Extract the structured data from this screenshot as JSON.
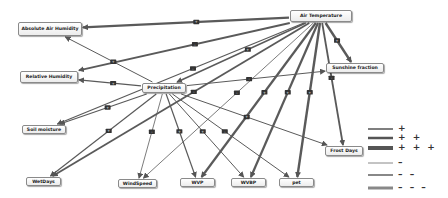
{
  "nodes": [
    {
      "id": "air_temp",
      "label": "Air Temperature",
      "x": 290,
      "y": 10,
      "w": 62,
      "h": 12
    },
    {
      "id": "abs_hum",
      "label": "Absolute Air Humidity",
      "x": 18,
      "y": 22,
      "w": 64,
      "h": 14
    },
    {
      "id": "rel_hum",
      "label": "Relative Humidity",
      "x": 20,
      "y": 71,
      "w": 58,
      "h": 12
    },
    {
      "id": "precip",
      "label": "Precipitation",
      "x": 142,
      "y": 83,
      "w": 44,
      "h": 10
    },
    {
      "id": "sunshine",
      "label": "Sunshine fraction",
      "x": 326,
      "y": 63,
      "w": 58,
      "h": 10
    },
    {
      "id": "soil",
      "label": "Soil moisture",
      "x": 22,
      "y": 125,
      "w": 44,
      "h": 9
    },
    {
      "id": "frost",
      "label": "Frost Days",
      "x": 325,
      "y": 146,
      "w": 38,
      "h": 10
    },
    {
      "id": "wetdays",
      "label": "WetDays",
      "x": 26,
      "y": 177,
      "w": 35,
      "h": 9
    },
    {
      "id": "windspeed",
      "label": "WindSpeed",
      "x": 118,
      "y": 179,
      "w": 39,
      "h": 9
    },
    {
      "id": "wvp",
      "label": "WVP",
      "x": 180,
      "y": 178,
      "w": 35,
      "h": 9
    },
    {
      "id": "wvbp",
      "label": "WVBP",
      "x": 231,
      "y": 178,
      "w": 35,
      "h": 9
    },
    {
      "id": "pet",
      "label": "pet",
      "x": 279,
      "y": 178,
      "w": 35,
      "h": 9
    }
  ],
  "edges": [
    {
      "from": "air_temp",
      "to": "abs_hum",
      "width": 2.2,
      "sign": "+"
    },
    {
      "from": "air_temp",
      "to": "rel_hum",
      "width": 1.8,
      "sign": "-"
    },
    {
      "from": "air_temp",
      "to": "sunshine",
      "width": 2.4,
      "sign": "+"
    },
    {
      "from": "air_temp",
      "to": "precip",
      "width": 1.4,
      "sign": "+"
    },
    {
      "from": "air_temp",
      "to": "soil",
      "width": 1.2,
      "sign": "-"
    },
    {
      "from": "air_temp",
      "to": "wetdays",
      "width": 1.8,
      "sign": "-"
    },
    {
      "from": "air_temp",
      "to": "windspeed",
      "width": 0.8,
      "sign": "-"
    },
    {
      "from": "air_temp",
      "to": "wvp",
      "width": 2.2,
      "sign": "+"
    },
    {
      "from": "air_temp",
      "to": "wvbp",
      "width": 2.2,
      "sign": "+"
    },
    {
      "from": "air_temp",
      "to": "pet",
      "width": 2.4,
      "sign": "+"
    },
    {
      "from": "air_temp",
      "to": "frost",
      "width": 1.8,
      "sign": "-"
    },
    {
      "from": "precip",
      "to": "abs_hum",
      "width": 1.0,
      "sign": "+"
    },
    {
      "from": "precip",
      "to": "rel_hum",
      "width": 1.2,
      "sign": "+"
    },
    {
      "from": "precip",
      "to": "soil",
      "width": 1.2,
      "sign": "+"
    },
    {
      "from": "precip",
      "to": "wetdays",
      "width": 1.2,
      "sign": "+"
    },
    {
      "from": "precip",
      "to": "windspeed",
      "width": 0.8,
      "sign": "-"
    },
    {
      "from": "precip",
      "to": "wvp",
      "width": 1.2,
      "sign": "+"
    },
    {
      "from": "precip",
      "to": "wvbp",
      "width": 1.0,
      "sign": "+"
    },
    {
      "from": "precip",
      "to": "pet",
      "width": 1.0,
      "sign": "-"
    },
    {
      "from": "precip",
      "to": "frost",
      "width": 1.0,
      "sign": "+"
    },
    {
      "from": "precip",
      "to": "sunshine",
      "width": 1.0,
      "sign": "-"
    }
  ],
  "legend": {
    "items": [
      {
        "sign": "+",
        "line_width": 1.5,
        "style": "positive"
      },
      {
        "sign": "+ +",
        "line_width": 2.5,
        "style": "positive"
      },
      {
        "sign": "+ + +",
        "line_width": 4,
        "style": "positive"
      },
      {
        "sign": "–",
        "line_width": 1,
        "style": "negative"
      },
      {
        "sign": "– –",
        "line_width": 2,
        "style": "negative"
      },
      {
        "sign": "– – –",
        "line_width": 3,
        "style": "negative"
      }
    ]
  },
  "colors": {
    "edge": "#5a5a5a",
    "marker": "#333333",
    "node_border": "#8a8a8a"
  }
}
